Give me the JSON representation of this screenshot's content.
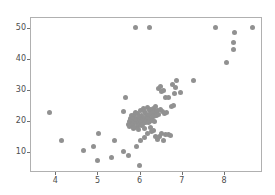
{
  "chart_data": {
    "type": "scatter",
    "title": "",
    "xlabel": "",
    "ylabel": "",
    "xlim": [
      3.4,
      8.9
    ],
    "ylim": [
      3.5,
      53.5
    ],
    "xticks": [
      4,
      5,
      6,
      7,
      8
    ],
    "yticks": [
      10,
      20,
      30,
      40,
      50
    ],
    "xtick_labels": [
      "4",
      "5",
      "6",
      "7",
      "8"
    ],
    "ytick_labels": [
      "10",
      "20",
      "30",
      "40",
      "50"
    ],
    "grid": false,
    "legend": null,
    "marker": {
      "shape": "circle",
      "color": "#919191",
      "size_px": 5
    },
    "axes_frame_color": "#b0b0b0",
    "background_color": "#ffffff",
    "points": [
      [
        3.85,
        23.0
      ],
      [
        4.12,
        14.0
      ],
      [
        4.65,
        10.6
      ],
      [
        4.88,
        12.0
      ],
      [
        4.97,
        7.6
      ],
      [
        5.0,
        16.3
      ],
      [
        5.32,
        8.4
      ],
      [
        5.38,
        14.0
      ],
      [
        5.6,
        10.4
      ],
      [
        5.6,
        23.2
      ],
      [
        5.63,
        28.0
      ],
      [
        5.7,
        9.2
      ],
      [
        5.72,
        19.2
      ],
      [
        5.73,
        20.1
      ],
      [
        5.74,
        18.4
      ],
      [
        5.75,
        21.0
      ],
      [
        5.76,
        19.6
      ],
      [
        5.77,
        20.4
      ],
      [
        5.78,
        18.9
      ],
      [
        5.79,
        22.0
      ],
      [
        5.8,
        19.0
      ],
      [
        5.81,
        20.8
      ],
      [
        5.82,
        17.8
      ],
      [
        5.83,
        21.5
      ],
      [
        5.84,
        19.4
      ],
      [
        5.85,
        22.4
      ],
      [
        5.86,
        18.2
      ],
      [
        5.87,
        20.2
      ],
      [
        5.88,
        50.5
      ],
      [
        5.88,
        23.0
      ],
      [
        5.89,
        19.8
      ],
      [
        5.9,
        21.2
      ],
      [
        5.9,
        12.2
      ],
      [
        5.91,
        20.6
      ],
      [
        5.92,
        18.6
      ],
      [
        5.93,
        22.8
      ],
      [
        5.94,
        19.1
      ],
      [
        5.95,
        20.9
      ],
      [
        5.96,
        17.4
      ],
      [
        5.97,
        21.8
      ],
      [
        5.98,
        5.8
      ],
      [
        5.98,
        20.0
      ],
      [
        5.99,
        23.6
      ],
      [
        6.0,
        19.5
      ],
      [
        6.0,
        14.1
      ],
      [
        6.01,
        21.4
      ],
      [
        6.02,
        18.8
      ],
      [
        6.03,
        22.2
      ],
      [
        6.04,
        20.3
      ],
      [
        6.05,
        19.3
      ],
      [
        6.06,
        24.2
      ],
      [
        6.07,
        21.0
      ],
      [
        6.08,
        15.0
      ],
      [
        6.08,
        20.7
      ],
      [
        6.09,
        18.0
      ],
      [
        6.1,
        23.4
      ],
      [
        6.11,
        22.6
      ],
      [
        6.12,
        19.9
      ],
      [
        6.13,
        21.6
      ],
      [
        6.14,
        20.5
      ],
      [
        6.15,
        24.6
      ],
      [
        6.16,
        16.2
      ],
      [
        6.17,
        22.0
      ],
      [
        6.18,
        19.7
      ],
      [
        6.19,
        21.3
      ],
      [
        6.2,
        50.5
      ],
      [
        6.2,
        23.8
      ],
      [
        6.21,
        20.1
      ],
      [
        6.22,
        22.4
      ],
      [
        6.23,
        18.3
      ],
      [
        6.24,
        24.0
      ],
      [
        6.25,
        21.1
      ],
      [
        6.26,
        16.8
      ],
      [
        6.27,
        23.2
      ],
      [
        6.28,
        20.4
      ],
      [
        6.29,
        22.8
      ],
      [
        6.3,
        24.4
      ],
      [
        6.3,
        17.2
      ],
      [
        6.31,
        21.7
      ],
      [
        6.32,
        23.5
      ],
      [
        6.33,
        20.0
      ],
      [
        6.34,
        22.1
      ],
      [
        6.35,
        24.8
      ],
      [
        6.36,
        15.4
      ],
      [
        6.37,
        23.0
      ],
      [
        6.38,
        21.9
      ],
      [
        6.4,
        23.6
      ],
      [
        6.4,
        14.2
      ],
      [
        6.42,
        22.5
      ],
      [
        6.43,
        30.8
      ],
      [
        6.45,
        15.2
      ],
      [
        6.46,
        23.9
      ],
      [
        6.48,
        31.5
      ],
      [
        6.5,
        29.8
      ],
      [
        6.5,
        16.4
      ],
      [
        6.52,
        23.3
      ],
      [
        6.54,
        30.2
      ],
      [
        6.55,
        14.0
      ],
      [
        6.57,
        22.7
      ],
      [
        6.6,
        15.8
      ],
      [
        6.6,
        27.8
      ],
      [
        6.62,
        23.1
      ],
      [
        6.65,
        16.0
      ],
      [
        6.66,
        28.0
      ],
      [
        6.7,
        15.6
      ],
      [
        6.72,
        25.0
      ],
      [
        6.75,
        32.2
      ],
      [
        6.78,
        25.2
      ],
      [
        6.8,
        29.2
      ],
      [
        6.82,
        31.0
      ],
      [
        6.86,
        33.4
      ],
      [
        6.95,
        29.4
      ],
      [
        7.25,
        33.5
      ],
      [
        7.78,
        50.5
      ],
      [
        8.04,
        39.2
      ],
      [
        8.2,
        43.5
      ],
      [
        8.21,
        45.6
      ],
      [
        8.23,
        48.9
      ],
      [
        8.65,
        50.5
      ]
    ]
  }
}
